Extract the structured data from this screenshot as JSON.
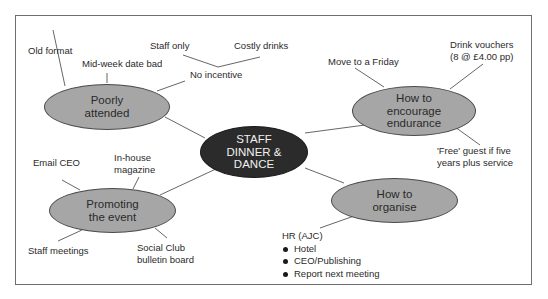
{
  "diagram": {
    "type": "mind-map",
    "center": {
      "label": "STAFF\nDINNER &\nDANCE"
    },
    "branches": [
      {
        "label": "Poorly\nattended",
        "children": [
          "Old format",
          "Mid-week date bad",
          "No incentive",
          "Staff only",
          "Costly drinks"
        ]
      },
      {
        "label": "How to\nencourage\nendurance",
        "children": [
          "Move to a Friday",
          "Drink vouchers\n(8 @ £4.00 pp)",
          "'Free' guest if five\nyears plus service"
        ]
      },
      {
        "label": "Promoting\nthe event",
        "children": [
          "Email CEO",
          "In-house\nmagazine",
          "Staff meetings",
          "Social Club\nbulletin board"
        ]
      },
      {
        "label": "How to\norganise",
        "children": [
          "HR (AJC)"
        ],
        "bullets": [
          "Hotel",
          "CEO/Publishing",
          "Report next meeting"
        ]
      }
    ]
  },
  "colors": {
    "center_fill": "#2b2b2b",
    "node_fill": "#a6a6a6",
    "line": "#555555",
    "frame": "#6e6e6e"
  }
}
